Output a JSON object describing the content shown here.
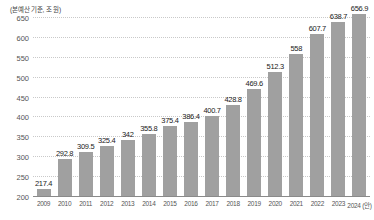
{
  "caption": "(본예산 기준, 조 원)",
  "chart_data": {
    "type": "bar",
    "title": "",
    "subtitle": "",
    "xlabel": "",
    "ylabel": "",
    "unit_note": "(본예산 기준, 조 원)",
    "grid": true,
    "legend": false,
    "ylim": [
      200,
      650
    ],
    "yticks": [
      200,
      250,
      300,
      350,
      400,
      450,
      500,
      550,
      600,
      650
    ],
    "ytick_labels": [
      "200",
      "250",
      "300",
      "350",
      "400",
      "450",
      "500",
      "550",
      "600",
      "650"
    ],
    "categories": [
      "2009",
      "2010",
      "2011",
      "2012",
      "2013",
      "2014",
      "2015",
      "2016",
      "2017",
      "2018",
      "2019",
      "2020",
      "2021",
      "2022",
      "2023",
      "2024 (안)"
    ],
    "values": [
      217.4,
      292.8,
      309.5,
      325.4,
      342,
      355.8,
      375.4,
      386.4,
      400.7,
      428.8,
      469.6,
      512.3,
      558,
      607.7,
      638.7,
      656.9
    ],
    "value_labels": [
      "217.4",
      "292.8",
      "309.5",
      "325.4",
      "342",
      "355.8",
      "375.4",
      "386.4",
      "400.7",
      "428.8",
      "469.6",
      "512.3",
      "558",
      "607.7",
      "638.7",
      "656.9"
    ],
    "bar_color": "#a0a0a0",
    "gridline_color": "#c9c9c9",
    "axis_color": "#8a8a8a"
  }
}
